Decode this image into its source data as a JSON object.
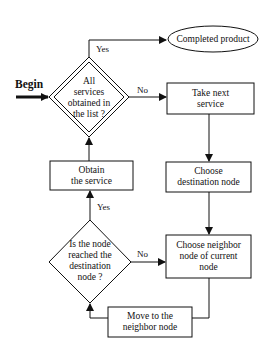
{
  "diagram": {
    "type": "flowchart",
    "start_label": "Begin",
    "nodes": {
      "completed": {
        "shape": "ellipse",
        "text": "Completed product"
      },
      "all_services": {
        "shape": "double-diamond",
        "line1": "All",
        "line2": "services",
        "line3": "obtained in",
        "line4": "the list ?"
      },
      "take_next": {
        "shape": "rect",
        "line1": "Take next",
        "line2": "service"
      },
      "obtain": {
        "shape": "rect",
        "line1": "Obtain",
        "line2": "the service"
      },
      "choose_dest": {
        "shape": "rect",
        "line1": "Choose",
        "line2": "destination node"
      },
      "reached": {
        "shape": "diamond",
        "line1": "Is the node",
        "line2": "reached the",
        "line3": "destination",
        "line4": "node ?"
      },
      "choose_neighbor": {
        "shape": "rect",
        "line1": "Choose neighbor",
        "line2": "node of current",
        "line3": "node"
      },
      "move": {
        "shape": "rect",
        "line1": "Move to the",
        "line2": "neighbor node"
      }
    },
    "edge_labels": {
      "all_yes": "Yes",
      "all_no": "No",
      "reached_yes": "Yes",
      "reached_no": "No"
    },
    "colors": {
      "stroke": "#111111",
      "background": "#ffffff"
    }
  }
}
